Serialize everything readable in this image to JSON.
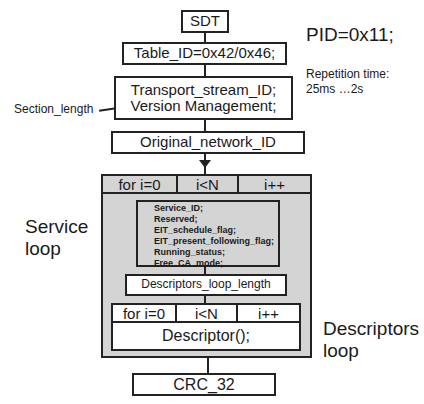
{
  "diagram": {
    "title_box": "SDT",
    "pid": "PID=0x11;",
    "repetition": [
      "Repetition time:",
      "25ms …2s"
    ],
    "table_id": "Table_ID=0x42/0x46;",
    "transport_box": [
      "Transport_stream_ID;",
      "Version Management;"
    ],
    "section_length_label": "Section_length",
    "original_network": "Original_network_ID",
    "service_loop": {
      "label": [
        "Service",
        "loop"
      ],
      "header": [
        "for i=0",
        "i<N",
        "i++"
      ],
      "fields": [
        "Service_ID;",
        "Reserved;",
        "EIT_schedule_flag;",
        "EIT_present_following_flag;",
        "Running_status;",
        "Free_CA_mode;"
      ],
      "descriptors_loop_length": "Descriptors_loop_length"
    },
    "descriptors_loop": {
      "label": [
        "Descriptors",
        "loop"
      ],
      "header": [
        "for i=0",
        "i<N",
        "i++"
      ],
      "body": "Descriptor();"
    },
    "crc": "CRC_32"
  },
  "colors": {
    "line": "#222222",
    "loop_fill": "#d4d4d4",
    "box_fill": "#ffffff"
  }
}
